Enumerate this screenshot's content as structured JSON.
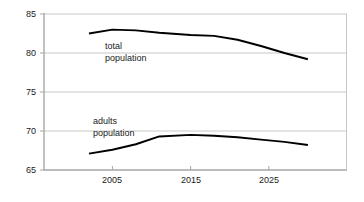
{
  "chart_data": {
    "type": "line",
    "title": "",
    "subtitle": "",
    "xlabel": "",
    "ylabel": "",
    "xlim": [
      2002,
      2030
    ],
    "ylim": [
      65,
      85
    ],
    "grid": true,
    "grid_axis": "y",
    "legend_position": "inline-annotations",
    "y_ticks": [
      65,
      70,
      75,
      80,
      85
    ],
    "y_tick_labels": [
      "65",
      "70",
      "75",
      "80",
      "85"
    ],
    "x_ticks": [
      2005,
      2015,
      2025
    ],
    "x_tick_labels": [
      "2005",
      "2015",
      "2025"
    ],
    "series": [
      {
        "name": "total population",
        "annotation_lines": [
          "total",
          "population"
        ],
        "color": "#000000",
        "x": [
          2002,
          2005,
          2008,
          2011,
          2015,
          2018,
          2021,
          2024,
          2027,
          2030
        ],
        "values": [
          82.5,
          83.0,
          82.9,
          82.6,
          82.3,
          82.2,
          81.7,
          80.9,
          80.0,
          79.2
        ]
      },
      {
        "name": "adults population",
        "annotation_lines": [
          "adults",
          "population"
        ],
        "color": "#000000",
        "x": [
          2002,
          2005,
          2008,
          2011,
          2015,
          2018,
          2021,
          2024,
          2027,
          2030
        ],
        "values": [
          67.1,
          67.6,
          68.3,
          69.3,
          69.5,
          69.4,
          69.2,
          68.9,
          68.6,
          68.2
        ]
      }
    ]
  },
  "axis": {
    "y_labels": [
      "85",
      "80",
      "75",
      "70",
      "65"
    ],
    "x_labels": [
      "2005",
      "2015",
      "2025"
    ]
  },
  "annotations": {
    "total": {
      "line1": "total",
      "line2": "population"
    },
    "adults": {
      "line1": "adults",
      "line2": "population"
    }
  },
  "colors": {
    "series_line": "#000000",
    "gridline": "#c8c8c8",
    "axis": "#a6a6a6",
    "text": "#1a1a1a",
    "background": "#ffffff"
  }
}
